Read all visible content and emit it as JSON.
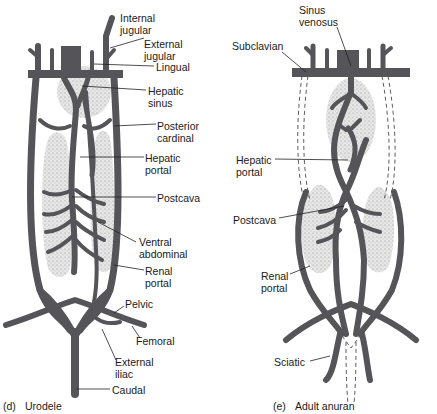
{
  "colors": {
    "vessel": "#555559",
    "organ_fill": "#e4e4e4",
    "stipple": "#9a9a9a",
    "leader": "#222222",
    "text": "#1a1a1a"
  },
  "panels": [
    {
      "id": "d",
      "caption_letter": "(d)",
      "caption_name": "Urodele",
      "labels": {
        "internal_jugular": "Internal\njugular",
        "external_jugular": "External\njugular",
        "lingual": "Lingual",
        "hepatic_sinus": "Hepatic\nsinus",
        "posterior_cardinal": "Posterior\ncardinal",
        "hepatic_portal": "Hepatic\nportal",
        "postcava": "Postcava",
        "ventral_abdominal": "Ventral\nabdominal",
        "renal_portal": "Renal\nportal",
        "pelvic": "Pelvic",
        "femoral": "Femoral",
        "external_iliac": "External\niliac",
        "caudal": "Caudal"
      }
    },
    {
      "id": "e",
      "caption_letter": "(e)",
      "caption_name": "Adult anuran",
      "labels": {
        "sinus_venosus": "Sinus\nvenosus",
        "subclavian": "Subclavian",
        "hepatic_portal": "Hepatic\nportal",
        "postcava": "Postcava",
        "renal_portal": "Renal\nportal",
        "sciatic": "Sciatic"
      }
    }
  ]
}
